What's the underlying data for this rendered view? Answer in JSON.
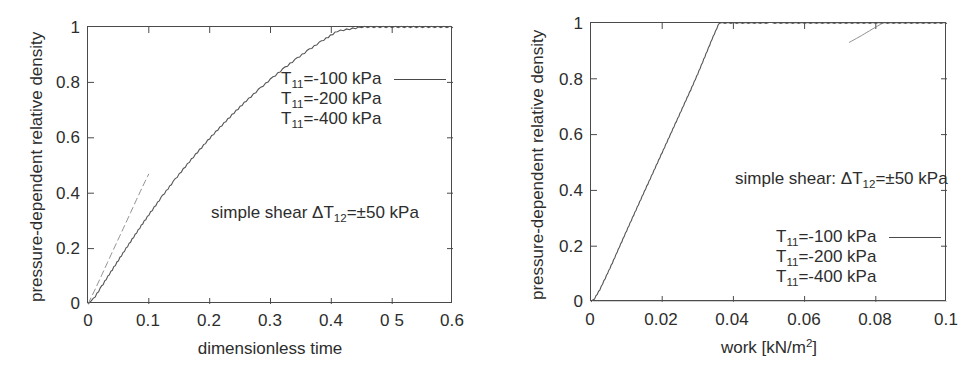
{
  "figure": {
    "background_color": "#ffffff",
    "line_color": "#4a4a4a",
    "text_color": "#2d2d2d"
  },
  "panels": [
    {
      "id": "left",
      "y_axis_title": "pressure-dependent relative density",
      "x_axis_title": "dimensionless time",
      "x_ticks": [
        "0",
        "0.1",
        "0.2",
        "0.3",
        "0.4",
        "0 5",
        "0.6"
      ],
      "y_ticks": [
        "0",
        "0.2",
        "0.4",
        "0.6",
        "0.8",
        "1"
      ],
      "annotation": "simple shear  ΔT₁₂=±50 kPa",
      "annotation_parts": {
        "prefix": "simple shear  ΔT",
        "sub": "12",
        "suffix": "=±50 kPa"
      },
      "legend": [
        {
          "prefix": "T",
          "sub": "11",
          "suffix": "=-100 kPa",
          "label": "T₁₁=-100 kPa",
          "has_sample": true
        },
        {
          "prefix": "T",
          "sub": "11",
          "suffix": "=-200 kPa",
          "label": "T₁₁=-200 kPa",
          "has_sample": false
        },
        {
          "prefix": "T",
          "sub": "11",
          "suffix": "=-400 kPa",
          "label": "T₁₁=-400 kPa",
          "has_sample": false
        }
      ]
    },
    {
      "id": "right",
      "y_axis_title": "pressure-dependent relative density",
      "x_axis_title_parts": {
        "prefix": "work [kN/m",
        "sup": "2",
        "suffix": "]"
      },
      "x_axis_title": "work [kN/m²]",
      "x_ticks": [
        "0",
        "0.02",
        "0.04",
        "0.06",
        "0.08",
        "0.1"
      ],
      "y_ticks": [
        "0",
        "0.2",
        "0.4",
        "0.6",
        "0.8",
        "1"
      ],
      "annotation": "simple shear: ΔT₁₂=±50 kPa",
      "annotation_parts": {
        "prefix": "simple shear: ΔT",
        "sub": "12",
        "suffix": "=±50 kPa"
      },
      "legend": [
        {
          "prefix": "T",
          "sub": "11",
          "suffix": "=-100 kPa",
          "label": "T₁₁=-100 kPa",
          "has_sample": true
        },
        {
          "prefix": "T",
          "sub": "11",
          "suffix": "=-200 kPa",
          "label": "T₁₁=-200 kPa",
          "has_sample": false
        },
        {
          "prefix": "T",
          "sub": "11",
          "suffix": "=-400 kPa",
          "label": "T₁₁=-400 kPa",
          "has_sample": false
        }
      ]
    }
  ],
  "chart_data": [
    {
      "type": "line",
      "panel": "left",
      "title": "",
      "xlabel": "dimensionless time",
      "ylabel": "pressure-dependent relative density",
      "xlim": [
        0,
        0.6
      ],
      "ylim": [
        0,
        1
      ],
      "xticks": [
        0,
        0.1,
        0.2,
        0.3,
        0.4,
        0.5,
        0.6
      ],
      "yticks": [
        0,
        0.2,
        0.4,
        0.6,
        0.8,
        1
      ],
      "grid": false,
      "legend_position": "upper-center-right",
      "annotations": [
        "simple shear  ΔT12=±50 kPa"
      ],
      "series": [
        {
          "name": "T11=-100 kPa",
          "style": "solid-rippled",
          "x": [
            0.0,
            0.005,
            0.012,
            0.02,
            0.03,
            0.04,
            0.05,
            0.06,
            0.07,
            0.08,
            0.09,
            0.1,
            0.12,
            0.14,
            0.16,
            0.18,
            0.2,
            0.22,
            0.24,
            0.26,
            0.28,
            0.3,
            0.32,
            0.34,
            0.36,
            0.38,
            0.395,
            0.41,
            0.45,
            0.5,
            0.55,
            0.6
          ],
          "y": [
            0.0,
            0.008,
            0.028,
            0.055,
            0.09,
            0.124,
            0.158,
            0.192,
            0.225,
            0.258,
            0.291,
            0.322,
            0.383,
            0.441,
            0.496,
            0.548,
            0.598,
            0.645,
            0.69,
            0.733,
            0.773,
            0.811,
            0.847,
            0.881,
            0.913,
            0.943,
            0.964,
            0.985,
            1.0,
            1.0,
            1.0,
            1.0
          ]
        },
        {
          "name": "T11=-200 kPa",
          "style": "faint-dashed",
          "x": [
            0.0,
            0.01,
            0.02,
            0.03,
            0.04,
            0.05,
            0.06,
            0.07,
            0.08,
            0.09,
            0.1
          ],
          "y": [
            0.0,
            0.045,
            0.092,
            0.14,
            0.188,
            0.235,
            0.282,
            0.33,
            0.378,
            0.425,
            0.47
          ]
        }
      ]
    },
    {
      "type": "line",
      "panel": "right",
      "title": "",
      "xlabel": "work [kN/m2]",
      "ylabel": "pressure-dependent relative density",
      "xlim": [
        0,
        0.1
      ],
      "ylim": [
        0,
        1
      ],
      "xticks": [
        0,
        0.02,
        0.04,
        0.06,
        0.08,
        0.1
      ],
      "yticks": [
        0,
        0.2,
        0.4,
        0.6,
        0.8,
        1
      ],
      "grid": false,
      "legend_position": "lower-right",
      "annotations": [
        "simple shear: ΔT12=±50 kPa"
      ],
      "series": [
        {
          "name": "T11=-100 kPa",
          "style": "solid-rippled",
          "x": [
            0.0,
            0.001,
            0.0025,
            0.004,
            0.006,
            0.008,
            0.01,
            0.012,
            0.014,
            0.016,
            0.018,
            0.02,
            0.022,
            0.024,
            0.026,
            0.028,
            0.03,
            0.032,
            0.034,
            0.036,
            0.05,
            0.07,
            0.09,
            0.1
          ],
          "y": [
            0.0,
            0.012,
            0.045,
            0.085,
            0.14,
            0.198,
            0.255,
            0.312,
            0.368,
            0.424,
            0.48,
            0.536,
            0.592,
            0.648,
            0.704,
            0.76,
            0.818,
            0.88,
            0.942,
            1.0,
            1.0,
            1.0,
            1.0,
            1.0
          ]
        },
        {
          "name": "T11=-400 kPa",
          "style": "faint-short",
          "x": [
            0.0725,
            0.076,
            0.079,
            0.082
          ],
          "y": [
            0.93,
            0.955,
            0.978,
            1.0
          ]
        }
      ]
    }
  ]
}
